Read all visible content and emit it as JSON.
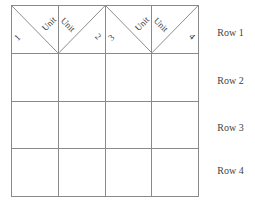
{
  "figure": {
    "name": "unit-row-grid",
    "grid": {
      "columns": 4,
      "rows": 4,
      "line_color": "#8a8a8a",
      "background": "#ffffff"
    }
  },
  "header": {
    "cells": [
      {
        "unit_label": "Unit",
        "number": "1",
        "diagonal": "backslash"
      },
      {
        "unit_label": "Unit",
        "number": "2",
        "diagonal": "slash"
      },
      {
        "unit_label": "Unit",
        "number": "3",
        "diagonal": "backslash"
      },
      {
        "unit_label": "Unit",
        "number": "4",
        "diagonal": "slash"
      }
    ]
  },
  "row_labels": [
    {
      "label": "Row 1"
    },
    {
      "label": "Row 2"
    },
    {
      "label": "Row 3"
    },
    {
      "label": "Row 4"
    }
  ],
  "body": {
    "rows": [
      {
        "cells": [
          "",
          "",
          "",
          ""
        ]
      },
      {
        "cells": [
          "",
          "",
          "",
          ""
        ]
      },
      {
        "cells": [
          "",
          "",
          "",
          ""
        ]
      }
    ]
  }
}
